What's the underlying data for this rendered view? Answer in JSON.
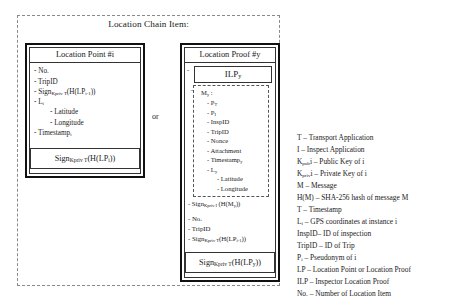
{
  "chain": {
    "title": "Location Chain Item:",
    "or_label": "or"
  },
  "location_point": {
    "header": "Location Point #i",
    "items": [
      "- No.",
      "- TripID",
      "- Sign",
      "- L",
      "-  Latitude",
      "-  Longitude",
      "- Timestamp"
    ],
    "item_no": "- No.",
    "item_tripid": "- TripID",
    "item_sign_prev": "- Sign",
    "item_sign_prev_sub": "Kpriv T",
    "item_sign_prev_arg": "(H(LP",
    "item_sign_prev_idx": "i-1",
    "item_sign_prev_close": "))",
    "item_l": "- L",
    "item_l_sub": "i",
    "item_latitude": "-   Latitude",
    "item_longitude": "-   Longitude",
    "item_timestamp": "- Timestamp",
    "item_timestamp_sub": "i",
    "signature": "Sign",
    "signature_sub": "Kpriv T",
    "signature_arg": "(H(LP",
    "signature_idx": "i",
    "signature_close": "))"
  },
  "location_proof": {
    "header": "Location Proof #y",
    "ilp_header": "ILP",
    "ilp_header_sub": "y",
    "ilp_lead_dash": "-",
    "my_label": "- M",
    "my_label_sub": "y",
    "my_colon": " :",
    "my_items": [
      "- P",
      "- P",
      "- InspID",
      "- TripID",
      "- Nonce",
      "- Attachment",
      "- Timestamp",
      "- L",
      "-   Latitude",
      "-   Longitude"
    ],
    "my_pt": "- P",
    "my_pt_sub": "T",
    "my_pi": "- P",
    "my_pi_sub": "I",
    "my_inspid": "- InspID",
    "my_tripid": "- TripID",
    "my_nonce": "- Nonce",
    "my_attachment": "- Attachment",
    "my_timestamp": "- Timestamp",
    "my_timestamp_sub": "y",
    "my_l": "- L",
    "my_l_sub": "y",
    "my_latitude": "-   Latitude",
    "my_longitude": "-   Longitude",
    "ilp_sign": "- Sign",
    "ilp_sign_sub": "Kpriv I",
    "ilp_sign_arg": " (H(M",
    "ilp_sign_idx": "y",
    "ilp_sign_close": "))",
    "item_no": "- No.",
    "item_tripid": "- TripID",
    "item_sign_prev": "- Sign",
    "item_sign_prev_sub": "Kpriv T",
    "item_sign_prev_arg": "(H(LP",
    "item_sign_prev_idx": "i-1",
    "item_sign_prev_close": "))",
    "signature": "Sign",
    "signature_sub": "Kpriv T",
    "signature_arg": "(H(LP",
    "signature_idx": "y",
    "signature_close": "))"
  },
  "legend": {
    "lines": [
      "T – Transport Application",
      "I – Inspect Application",
      "Kpubi – Public Key of i",
      "Kprivi – Private Key of i",
      "M – Message",
      "H(M) – SHA-256 hash of message M",
      "T – Timestamp",
      "Li – GPS coordinates at instance i",
      "InspID– ID of inspection",
      "TripID – ID of Trip",
      "Pi – Pseudonym of i",
      "LP – Location Point or Location Proof",
      "ILP – Inspector Location Proof",
      "No. – Number of Location Item"
    ],
    "l1": "T – Transport Application",
    "l2": "I – Inspect Application",
    "l3_a": "K",
    "l3_sub": "pub",
    "l3_b": "i – Public Key of i",
    "l4_a": "K",
    "l4_sub": "priv",
    "l4_b": "i – Private Key of i",
    "l5": "M – Message",
    "l6": "H(M) – SHA-256 hash of message M",
    "l7": "T – Timestamp",
    "l8_a": "L",
    "l8_sub": "i",
    "l8_b": " – GPS coordinates at instance i",
    "l9": "InspID– ID of inspection",
    "l10": "TripID – ID of Trip",
    "l11_a": "P",
    "l11_sub": "i",
    "l11_b": " – Pseudonym of i",
    "l12": "LP – Location Point or Location Proof",
    "l13": "ILP – Inspector Location Proof",
    "l14": "No. – Number of Location Item"
  },
  "colors": {
    "border": "#111111",
    "dashed": "#8a8a8a",
    "text": "#1a1a1a"
  }
}
